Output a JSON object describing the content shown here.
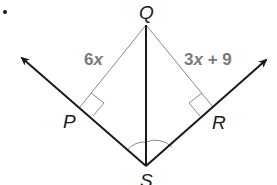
{
  "diagram": {
    "type": "geometry-angle-bisector",
    "points": {
      "Q": {
        "label": "Q",
        "x": 146,
        "y": 25
      },
      "S": {
        "label": "S",
        "x": 146,
        "y": 166
      },
      "P": {
        "label": "P",
        "x": 80,
        "y": 107
      },
      "R": {
        "label": "R",
        "x": 213,
        "y": 107
      }
    },
    "segments": {
      "QP": {
        "label": "6x",
        "coef": "6",
        "var": "x"
      },
      "QR": {
        "label": "3x + 9",
        "coef": "3",
        "var": "x",
        "rest": " + 9"
      }
    },
    "rays": [
      "SP",
      "SR"
    ],
    "right_angles": [
      "P",
      "R"
    ],
    "congruent_angles": [
      "PSQ",
      "QSR"
    ],
    "colors": {
      "ray": "#1a1a1a",
      "segment": "#8a8a8a",
      "expression": "#7a7a7a"
    }
  }
}
